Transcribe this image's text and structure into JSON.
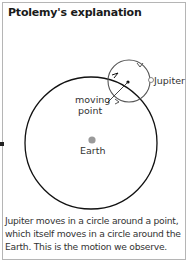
{
  "title": "Ptolemy's explanation",
  "labels": {
    "jupiter": "Jupiter",
    "moving_point_line1": "moving",
    "moving_point_line2": "point",
    "earth": "Earth"
  },
  "caption": "Jupiter moves in a circle around a point, which itself moves in a circle around the Earth. This is the motion we observe.",
  "colors": {
    "earth_dot": "#9a9a9a",
    "circle_stroke": "#111111",
    "epicycle_stroke": "#555555",
    "border": "#b5b5b5"
  }
}
